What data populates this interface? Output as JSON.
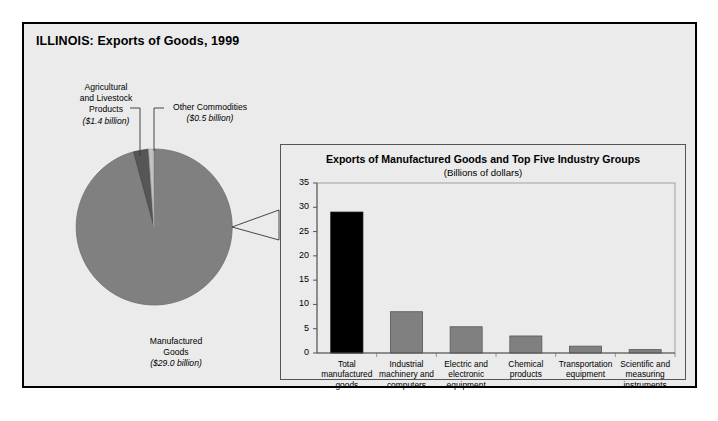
{
  "figure": {
    "title": "ILLINOIS: Exports of Goods, 1999"
  },
  "pie": {
    "labels": {
      "agricultural": {
        "name": "Agricultural\nand Livestock\nProducts",
        "line1": "Agricultural",
        "line2": "and Livestock",
        "line3": "Products",
        "amount": "($1.4 billion)"
      },
      "other": {
        "line1": "Other Commodities",
        "amount": "($0.5 billion)"
      },
      "manufactured": {
        "line1": "Manufactured",
        "line2": "Goods",
        "amount": "($29.0 billion)"
      }
    }
  },
  "bar_panel": {
    "title": "Exports of Manufactured Goods and Top Five Industry Groups",
    "subtitle": "(Billions of dollars)"
  },
  "colors": {
    "figure_background": "#ebebeb",
    "frame": "#000000",
    "pie_manufactured": "#808080",
    "pie_agricultural": "#565656",
    "pie_other": "#c3c3c3",
    "bar_total": "#000000",
    "bar_group": "#808080",
    "axis": "#555555"
  },
  "chart_data": [
    {
      "type": "pie",
      "title": "ILLINOIS: Exports of Goods, 1999",
      "unit": "billions of dollars",
      "labels": [
        "Manufactured Goods",
        "Agricultural and Livestock Products",
        "Other Commodities"
      ],
      "values": [
        29.0,
        1.4,
        0.5
      ],
      "value_labels": [
        "($29.0 billion)",
        "($1.4 billion)",
        "($0.5 billion)"
      ],
      "colors": [
        "#808080",
        "#565656",
        "#c3c3c3"
      ],
      "legend": "none",
      "start_angle": 90,
      "direction": "counterclockwise"
    },
    {
      "type": "bar",
      "title": "Exports of Manufactured Goods and Top Five Industry Groups",
      "subtitle": "(Billions of dollars)",
      "xlabel": "",
      "ylabel": "",
      "categories": [
        "Total manufactured goods",
        "Industrial machinery and computers",
        "Electric and electronic equipment",
        "Chemical products",
        "Transportation equipment",
        "Scientific and measuring instruments"
      ],
      "category_lines": [
        [
          "Total",
          "manufactured",
          "goods"
        ],
        [
          "Industrial",
          "machinery and",
          "computers"
        ],
        [
          "Electric and",
          "electronic",
          "equipment"
        ],
        [
          "Chemical",
          "products"
        ],
        [
          "Transportation",
          "equipment"
        ],
        [
          "Scientific and",
          "measuring",
          "instruments"
        ]
      ],
      "values": [
        29.0,
        8.5,
        5.4,
        3.5,
        1.4,
        0.7
      ],
      "bar_colors": [
        "#000000",
        "#808080",
        "#808080",
        "#808080",
        "#808080",
        "#808080"
      ],
      "ylim": [
        0,
        35
      ],
      "yticks": [
        0,
        5,
        10,
        15,
        20,
        25,
        30,
        35
      ],
      "ytick_labels": [
        "0",
        "5",
        "10",
        "15",
        "20",
        "25",
        "30",
        "35"
      ],
      "grid": false,
      "legend": "none"
    }
  ]
}
